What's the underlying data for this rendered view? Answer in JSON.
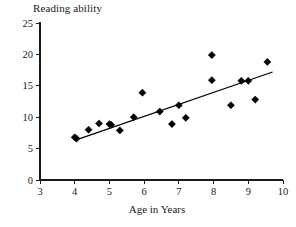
{
  "chart_data": {
    "type": "scatter",
    "title": "Reading ability",
    "xlabel": "Age in Years",
    "ylabel": "Reading ability",
    "xlim": [
      3,
      10
    ],
    "ylim": [
      0,
      25
    ],
    "xticks": [
      3,
      4,
      5,
      6,
      7,
      8,
      9,
      10
    ],
    "yticks": [
      0,
      5,
      10,
      15,
      20,
      25
    ],
    "grid": false,
    "legend": null,
    "marker": "diamond",
    "marker_color": "#000000",
    "points": [
      {
        "x": 4.0,
        "y": 6.8
      },
      {
        "x": 4.05,
        "y": 6.6
      },
      {
        "x": 4.4,
        "y": 8.0
      },
      {
        "x": 4.7,
        "y": 9.0
      },
      {
        "x": 5.0,
        "y": 8.9
      },
      {
        "x": 5.05,
        "y": 8.8
      },
      {
        "x": 5.3,
        "y": 7.9
      },
      {
        "x": 5.7,
        "y": 10.0
      },
      {
        "x": 5.95,
        "y": 13.9
      },
      {
        "x": 6.45,
        "y": 10.9
      },
      {
        "x": 6.8,
        "y": 8.9
      },
      {
        "x": 7.0,
        "y": 11.9
      },
      {
        "x": 7.2,
        "y": 9.9
      },
      {
        "x": 7.95,
        "y": 19.9
      },
      {
        "x": 7.95,
        "y": 15.9
      },
      {
        "x": 8.5,
        "y": 11.9
      },
      {
        "x": 8.8,
        "y": 15.8
      },
      {
        "x": 9.0,
        "y": 15.8
      },
      {
        "x": 9.2,
        "y": 12.8
      },
      {
        "x": 9.55,
        "y": 18.8
      }
    ],
    "trend_line": {
      "label": "regression line",
      "x_start": 4.0,
      "y_start": 6.3,
      "x_end": 9.7,
      "y_end": 17.2
    }
  }
}
